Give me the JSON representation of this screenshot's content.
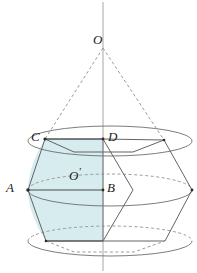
{
  "figure": {
    "background_color": "#ffffff",
    "stroke_color": "#4a4a4a",
    "dash_color": "#8a8a8a",
    "shade_color": "#d6ecee",
    "axis_color": "#9a9a9a",
    "label_color": "#1a1a1a"
  },
  "labels": {
    "apex": "O",
    "upper_left": "C",
    "upper_right": "D",
    "mid_left": "A",
    "mid_right": "B",
    "center": "O"
  },
  "points": {
    "O": {
      "x": 103,
      "y": 48,
      "label_x": 93,
      "label_y": 33
    },
    "C": {
      "x": 45,
      "y": 139,
      "label_x": 31,
      "label_y": 130
    },
    "D": {
      "x": 103,
      "y": 139,
      "label_x": 108,
      "label_y": 130
    },
    "A": {
      "x": 28,
      "y": 190,
      "label_x": 7,
      "label_y": 181
    },
    "B": {
      "x": 103,
      "y": 190,
      "label_x": 107,
      "label_y": 181
    },
    "Oprime": {
      "x": 103,
      "y": 176,
      "label_x": 69,
      "label_y": 166
    },
    "top_right": {
      "x": 164,
      "y": 140
    },
    "right": {
      "x": 192,
      "y": 190
    },
    "bottom_right": {
      "x": 165,
      "y": 241
    },
    "bottom_left": {
      "x": 46,
      "y": 241
    },
    "front_mid": {
      "x": 133,
      "y": 190
    },
    "front_top": {
      "x": 103,
      "y": 139
    },
    "front_bottom": {
      "x": 103,
      "y": 241
    }
  },
  "axis": {
    "x": 103,
    "y_top": 2,
    "y_bottom": 271
  },
  "ellipses": {
    "top": {
      "cx": 110,
      "cy": 141,
      "rx": 82,
      "ry": 15
    },
    "middle": {
      "cx": 110,
      "cy": 190,
      "rx": 82,
      "ry": 16
    },
    "bottom": {
      "cx": 110,
      "cy": 241,
      "rx": 82,
      "ry": 15
    }
  },
  "segments": {
    "cone_left": "O to C",
    "cone_right": "O to top-right vertex",
    "axis_line": "vertical center axis",
    "AB": "A to B",
    "CD": "C to D"
  }
}
